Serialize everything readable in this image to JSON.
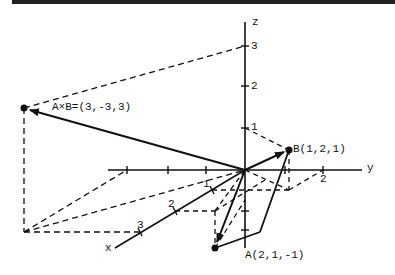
{
  "figure": {
    "axes": {
      "x_label": "x",
      "y_label": "y",
      "z_label": "z",
      "z_ticks": [
        "1",
        "2",
        "3"
      ],
      "x_ticks": [
        "1",
        "2",
        "3"
      ],
      "y_ticks": [
        "2"
      ]
    },
    "vectors": {
      "A": {
        "label": "A(2,1,-1)",
        "components": [
          2,
          1,
          -1
        ]
      },
      "B": {
        "label": "B(1,2,1)",
        "components": [
          1,
          2,
          1
        ]
      },
      "AxB": {
        "label": "A×B=(3,-3,3)",
        "components": [
          3,
          -3,
          3
        ]
      }
    },
    "colors": {
      "ink": "#111111",
      "background": "#ffffff"
    }
  }
}
